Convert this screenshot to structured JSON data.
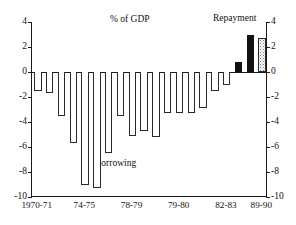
{
  "annotations": {
    "gdp": "% of GDP",
    "repayment": "Repayment",
    "borrowing": "Borrowing"
  },
  "chart_data": {
    "type": "bar",
    "title": "",
    "subtitle": "",
    "xlabel": "",
    "ylabel": "% of GDP",
    "ylim": [
      -10,
      4
    ],
    "grid": false,
    "legend": "none",
    "yticks_left": [
      "4",
      "2",
      "0",
      "-2",
      "-4",
      "-6",
      "-8",
      "-10"
    ],
    "yticks_right": [
      "4",
      "2",
      "0",
      "-2",
      "-4",
      "-6",
      "-8",
      "-10"
    ],
    "ytick_values": [
      4,
      2,
      0,
      -2,
      -4,
      -6,
      -8,
      -10
    ],
    "xtick_labels": [
      "1970-71",
      "74-75",
      "78-79",
      "79-80",
      "82-83",
      "89-90"
    ],
    "xtick_index": [
      0,
      4,
      8,
      12,
      16,
      19
    ],
    "categories": [
      "1970-71",
      "1971-72",
      "1972-73",
      "1973-74",
      "74-75",
      "1975-76",
      "1976-77",
      "1977-78",
      "78-79",
      "1979-80",
      "1980-81",
      "1981-82",
      "79-80",
      "1983-84",
      "1984-85",
      "1985-86",
      "82-83",
      "1987-88",
      "1988-89",
      "89-90"
    ],
    "values": [
      -1.5,
      -1.7,
      -3.5,
      -5.7,
      -9.0,
      -9.3,
      -6.5,
      -3.5,
      -5.1,
      -4.7,
      -5.2,
      -3.3,
      -3.3,
      -3.3,
      -2.9,
      -1.5,
      -1.0,
      0.8,
      3.0,
      2.7
    ],
    "bar_styles": [
      "hollow",
      "hollow",
      "hollow",
      "hollow",
      "hollow",
      "hollow",
      "hollow",
      "hollow",
      "hollow",
      "hollow",
      "hollow",
      "hollow",
      "hollow",
      "hollow",
      "hollow",
      "hollow",
      "hollow",
      "solid",
      "solid",
      "stipple"
    ],
    "series_labels": {
      "negative": "Borrowing",
      "positive": "Repayment"
    },
    "colors": {
      "axis": "#1a1a1a",
      "bar_outline": "#2a2a2a",
      "bar_fill_hollow": "#ffffff",
      "bar_fill_solid": "#111111",
      "bar_fill_stipple": "#ffffff",
      "background": "#ffffff"
    }
  }
}
